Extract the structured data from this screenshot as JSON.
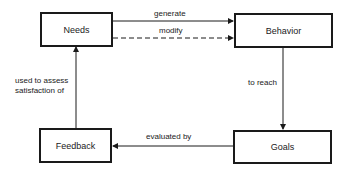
{
  "diagram": {
    "nodes": {
      "needs": "Needs",
      "behavior": "Behavior",
      "feedback": "Feedback",
      "goals": "Goals"
    },
    "edges": [
      {
        "from": "Needs",
        "to": "Behavior",
        "label": "generate",
        "style": "solid"
      },
      {
        "from": "Needs",
        "to": "Behavior",
        "label": "modify",
        "style": "dashed"
      },
      {
        "from": "Behavior",
        "to": "Goals",
        "label": "to reach",
        "style": "solid"
      },
      {
        "from": "Goals",
        "to": "Feedback",
        "label": "evaluated by",
        "style": "solid"
      },
      {
        "from": "Feedback",
        "to": "Needs",
        "label_line1": "used to assess",
        "label_line2": "satisfaction of",
        "style": "solid"
      }
    ],
    "colors": {
      "line": "#1a1a1a",
      "background": "#ffffff"
    }
  }
}
